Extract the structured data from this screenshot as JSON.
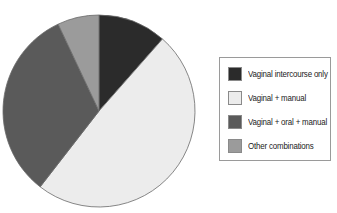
{
  "chart_data": {
    "type": "pie",
    "title": "",
    "categories": [
      "Vaginal intercourse only",
      "Vaginal + manual",
      "Vaginal + oral + manual",
      "Other combinations"
    ],
    "values": [
      11.5,
      49,
      32.5,
      7
    ],
    "unit": "percent (estimated from slice angles)",
    "colors": [
      "#2b2b2b",
      "#ececec",
      "#5a5a5a",
      "#9b9b9b"
    ],
    "start_angle_deg": 0,
    "direction": "clockwise",
    "legend_position": "right"
  },
  "legend": {
    "items": [
      {
        "label": "Vaginal intercourse only",
        "color": "#2b2b2b"
      },
      {
        "label": "Vaginal + manual",
        "color": "#ececec"
      },
      {
        "label": "Vaginal + oral + manual",
        "color": "#5a5a5a"
      },
      {
        "label": "Other combinations",
        "color": "#9b9b9b"
      }
    ]
  }
}
